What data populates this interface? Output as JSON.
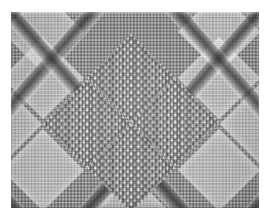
{
  "image": {
    "kind": "fabric-texture-photograph",
    "subject": "knitted wool swatch with diamond cable lattice and bobble stitches",
    "colorspace": "grayscale",
    "width_px": 268,
    "height_px": 221,
    "caption": ""
  },
  "canvas": {
    "background_color": "#ffffff",
    "margin_left_px": 11,
    "margin_top_px": 12,
    "swatch_width_px": 248,
    "swatch_height_px": 196
  },
  "palette": {
    "ground_light": "#d2d2d2",
    "ground_mid": "#c2c2c2",
    "cable_dark": "#6b6b6b",
    "cable_shadow": "#3a3a3a",
    "bobble_highlight": "#f2f2f2",
    "bobble_base": "#9d9d9d",
    "plain_diamond": "#e2e2e2",
    "paper_white": "#ffffff"
  },
  "pattern": {
    "lattice_type": "diagonal-diamond",
    "cord_angle_deg": 49,
    "diamond_period_x_px": 83,
    "diamond_period_y_px": 96,
    "cord_width_px": 14,
    "bobble_spacing_px": 7.2,
    "bobble_rows_per_diamond": 8,
    "ground_stitch_px": 3.3
  },
  "bobble_diamonds": [
    {
      "name": "top-center-bobble-diamond",
      "cx": 120,
      "cy": 66,
      "size": 62
    },
    {
      "name": "left-center-bobble-diamond",
      "cx": 76,
      "cy": 112,
      "size": 62
    },
    {
      "name": "right-center-bobble-diamond",
      "cx": 164,
      "cy": 110,
      "size": 62
    },
    {
      "name": "bottom-center-bobble-diamond",
      "cx": 120,
      "cy": 156,
      "size": 62
    }
  ],
  "plain_diamonds": [
    {
      "name": "plain-diamond-top-left",
      "cx": 32,
      "cy": 20,
      "size": 58
    },
    {
      "name": "plain-diamond-top-right",
      "cx": 208,
      "cy": 20,
      "size": 58
    },
    {
      "name": "plain-diamond-upper-left",
      "cx": 32,
      "cy": 66,
      "size": 58
    },
    {
      "name": "plain-diamond-upper-right",
      "cx": 208,
      "cy": 66,
      "size": 58
    },
    {
      "name": "plain-diamond-mid-left",
      "cx": -10,
      "cy": 112,
      "size": 58
    },
    {
      "name": "plain-diamond-mid-right",
      "cx": 250,
      "cy": 112,
      "size": 58
    },
    {
      "name": "plain-diamond-lower-left",
      "cx": 32,
      "cy": 158,
      "size": 58
    },
    {
      "name": "plain-diamond-lower-right",
      "cx": 208,
      "cy": 158,
      "size": 58
    },
    {
      "name": "plain-diamond-bottom-center",
      "cx": 120,
      "cy": 202,
      "size": 58
    }
  ]
}
